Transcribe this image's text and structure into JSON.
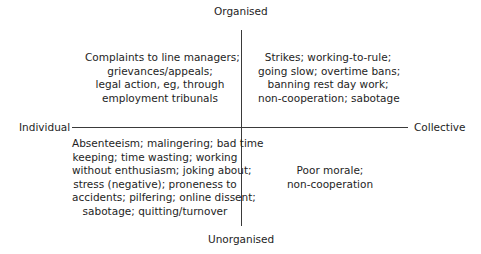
{
  "axes": {
    "top": "Organised",
    "bottom": "Unorganised",
    "left": "Individual",
    "right": "Collective"
  },
  "quadrants": {
    "individual_organised": {
      "lines": [
        "Complaints to line managers;",
        "grievances/appeals;",
        "legal action, eg, through",
        "employment tribunals"
      ]
    },
    "collective_organised": {
      "lines": [
        "Strikes; working-to-rule;",
        "going slow; overtime bans;",
        "banning rest day work;",
        "non-cooperation; sabotage"
      ]
    },
    "individual_unorganised": {
      "lines": [
        "Absenteeism; malingering; bad time",
        "keeping; time wasting; working",
        "without enthusiasm; joking about;",
        "stress (negative); proneness to",
        "accidents; pilfering; online dissent;",
        "sabotage; quitting/turnover"
      ]
    },
    "collective_unorganised": {
      "lines": [
        "Poor morale;",
        "non-cooperation"
      ]
    }
  },
  "colors": {
    "text": "#1e1e1e",
    "axis_line": "#3a3a3a",
    "background": "#ffffff"
  }
}
